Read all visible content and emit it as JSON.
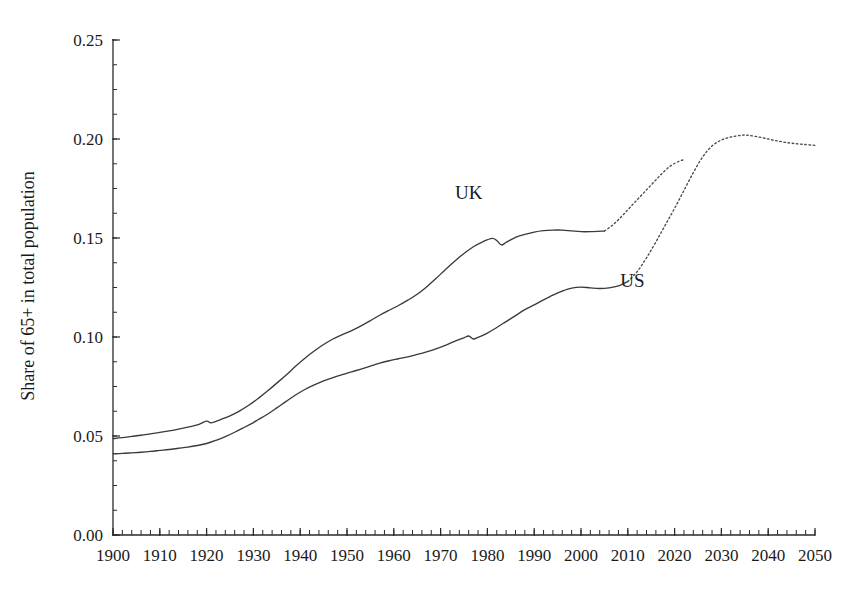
{
  "chart_data": {
    "type": "line",
    "title": "",
    "subtitle": "",
    "xlabel": "",
    "ylabel": "Share of 65+ in total population",
    "xlim": [
      1900,
      2050
    ],
    "ylim": [
      0.0,
      0.25
    ],
    "grid": false,
    "legend_position": "inline-annotation",
    "y_ticks": [
      "0.00",
      "0.05",
      "0.10",
      "0.15",
      "0.20",
      "0.25"
    ],
    "y_tick_values": [
      0.0,
      0.05,
      0.1,
      0.15,
      0.2,
      0.25
    ],
    "y_minor_tick_step": 0.0125,
    "x_ticks": [
      "1900",
      "1910",
      "1920",
      "1930",
      "1940",
      "1950",
      "1960",
      "1970",
      "1980",
      "1990",
      "2000",
      "2010",
      "2020",
      "2030",
      "2040",
      "2050"
    ],
    "x_tick_values": [
      1900,
      1910,
      1920,
      1930,
      1940,
      1950,
      1960,
      1970,
      1980,
      1990,
      2000,
      2010,
      2020,
      2030,
      2040,
      2050
    ],
    "x_minor_tick_step": 2,
    "annotations": [
      {
        "text": "UK",
        "x": 1976,
        "y": 0.1695
      },
      {
        "text": "US",
        "x": 2011,
        "y": 0.1255
      }
    ],
    "series": [
      {
        "name": "UK",
        "style": "solid-then-dotted",
        "observed_end_year": 2005,
        "color": "#3a3a3a",
        "x": [
          1900,
          1902,
          1904,
          1906,
          1908,
          1910,
          1912,
          1914,
          1916,
          1918,
          1920,
          1921,
          1923,
          1925,
          1927,
          1929,
          1931,
          1933,
          1935,
          1937,
          1939,
          1941,
          1943,
          1945,
          1947,
          1949,
          1951,
          1953,
          1955,
          1957,
          1959,
          1961,
          1963,
          1965,
          1967,
          1969,
          1971,
          1973,
          1975,
          1977,
          1979,
          1981,
          1982,
          1983,
          1984,
          1986,
          1988,
          1990,
          1992,
          1994,
          1996,
          1998,
          2000,
          2002,
          2005,
          2007,
          2009,
          2011,
          2013,
          2015,
          2017,
          2019,
          2021,
          2022
        ],
        "y": [
          0.0487,
          0.0492,
          0.0498,
          0.0504,
          0.0511,
          0.0518,
          0.0526,
          0.0535,
          0.0545,
          0.0556,
          0.0575,
          0.0566,
          0.0583,
          0.0602,
          0.0626,
          0.0655,
          0.0689,
          0.0727,
          0.0767,
          0.0808,
          0.0852,
          0.0893,
          0.0929,
          0.0962,
          0.099,
          0.1012,
          0.1032,
          0.1056,
          0.1083,
          0.111,
          0.1135,
          0.1159,
          0.1186,
          0.1216,
          0.1253,
          0.1295,
          0.134,
          0.1383,
          0.1422,
          0.1456,
          0.1481,
          0.1498,
          0.1487,
          0.1465,
          0.1478,
          0.1503,
          0.1518,
          0.153,
          0.1537,
          0.154,
          0.154,
          0.1536,
          0.1532,
          0.1532,
          0.1535,
          0.157,
          0.1617,
          0.1668,
          0.1718,
          0.1768,
          0.1818,
          0.1862,
          0.1888,
          0.1895
        ]
      },
      {
        "name": "US",
        "style": "solid-then-dotted",
        "observed_end_year": 2010,
        "color": "#3a3a3a",
        "x": [
          1900,
          1902,
          1904,
          1906,
          1908,
          1910,
          1912,
          1914,
          1916,
          1918,
          1920,
          1922,
          1924,
          1926,
          1928,
          1930,
          1931,
          1933,
          1935,
          1937,
          1939,
          1941,
          1943,
          1945,
          1947,
          1949,
          1951,
          1953,
          1955,
          1957,
          1959,
          1961,
          1963,
          1965,
          1967,
          1969,
          1971,
          1973,
          1975,
          1976,
          1977,
          1978,
          1980,
          1982,
          1984,
          1986,
          1988,
          1990,
          1992,
          1994,
          1996,
          1998,
          2000,
          2002,
          2004,
          2006,
          2008,
          2010,
          2012,
          2014,
          2016,
          2018,
          2020,
          2022,
          2024,
          2026,
          2028,
          2030,
          2032,
          2034,
          2035,
          2036,
          2038,
          2040,
          2042,
          2044,
          2046,
          2048,
          2050
        ],
        "y": [
          0.041,
          0.0412,
          0.0415,
          0.0418,
          0.0422,
          0.0427,
          0.0432,
          0.0438,
          0.0444,
          0.0452,
          0.0462,
          0.0478,
          0.0497,
          0.0519,
          0.0543,
          0.0568,
          0.0582,
          0.061,
          0.0642,
          0.0675,
          0.0707,
          0.0735,
          0.0758,
          0.0778,
          0.0795,
          0.081,
          0.0824,
          0.0838,
          0.0853,
          0.0868,
          0.088,
          0.089,
          0.09,
          0.0912,
          0.0925,
          0.094,
          0.0958,
          0.0978,
          0.0996,
          0.1005,
          0.099,
          0.0998,
          0.102,
          0.1048,
          0.1078,
          0.1108,
          0.1138,
          0.1162,
          0.1188,
          0.1212,
          0.1232,
          0.1247,
          0.1252,
          0.1248,
          0.1245,
          0.1248,
          0.1258,
          0.128,
          0.133,
          0.14,
          0.148,
          0.1565,
          0.165,
          0.174,
          0.183,
          0.191,
          0.1965,
          0.1995,
          0.201,
          0.2018,
          0.202,
          0.2018,
          0.201,
          0.2,
          0.199,
          0.1982,
          0.1976,
          0.1972,
          0.1968
        ]
      }
    ]
  },
  "colors": {
    "background": "#ffffff",
    "axis": "#2a2a2a",
    "line": "#3a3a3a",
    "text": "#1a1a1a"
  }
}
